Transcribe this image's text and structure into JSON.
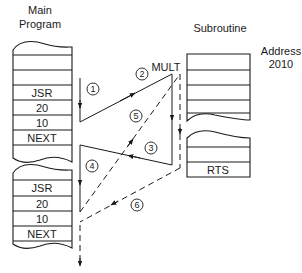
{
  "labels": {
    "main_program_line1": "Main",
    "main_program_line2": "Program",
    "subroutine": "Subroutine",
    "address_line1": "Address",
    "address_line2": "2010",
    "mult": "MULT"
  },
  "main_program_block_1": {
    "cells": [
      "",
      "",
      "",
      "JSR",
      "20",
      "10",
      "NEXT",
      ""
    ]
  },
  "main_program_block_2": {
    "cells": [
      "",
      "JSR",
      "20",
      "10",
      "NEXT"
    ]
  },
  "subroutine_block": {
    "top_cells": [
      "",
      "",
      "",
      "",
      ""
    ],
    "bottom_cells": [
      "",
      "",
      "RTS"
    ]
  },
  "steps": [
    {
      "id": "1",
      "label": "1",
      "style": "solid"
    },
    {
      "id": "2",
      "label": "2",
      "style": "solid"
    },
    {
      "id": "3",
      "label": "3",
      "style": "solid"
    },
    {
      "id": "4",
      "label": "4",
      "style": "solid"
    },
    {
      "id": "5",
      "label": "5",
      "style": "dashed"
    },
    {
      "id": "6",
      "label": "6",
      "style": "dashed"
    }
  ]
}
